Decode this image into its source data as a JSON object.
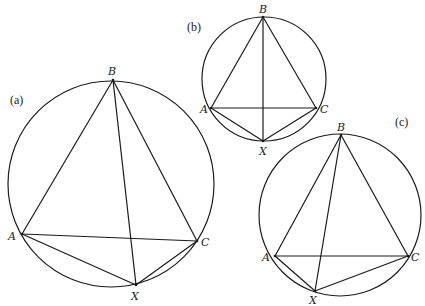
{
  "figure": {
    "width": 425,
    "height": 306,
    "background": "#ffffff",
    "stroke_color": "#1a1a1a"
  },
  "panels": [
    {
      "id": "a",
      "label": "(a)",
      "label_pos": [
        10,
        104
      ],
      "circle": {
        "cx": 111,
        "cy": 184,
        "r": 103
      },
      "points": {
        "A": {
          "label": "A",
          "x": 22,
          "y": 234,
          "lx": 8,
          "ly": 240
        },
        "B": {
          "label": "B",
          "x": 113,
          "y": 80,
          "lx": 108,
          "ly": 75
        },
        "C": {
          "label": "C",
          "x": 197,
          "y": 241,
          "lx": 201,
          "ly": 246
        },
        "X": {
          "label": "X",
          "x": 136,
          "y": 285,
          "lx": 131,
          "ly": 300
        }
      },
      "segments": [
        [
          "A",
          "B"
        ],
        [
          "B",
          "C"
        ],
        [
          "A",
          "C"
        ],
        [
          "B",
          "X"
        ],
        [
          "A",
          "X"
        ],
        [
          "C",
          "X"
        ]
      ]
    },
    {
      "id": "b",
      "label": "(b)",
      "label_pos": [
        187,
        31
      ],
      "circle": {
        "cx": 264,
        "cy": 79,
        "r": 62
      },
      "points": {
        "A": {
          "label": "A",
          "x": 211,
          "y": 108,
          "lx": 200,
          "ly": 113
        },
        "B": {
          "label": "B",
          "x": 263,
          "y": 17,
          "lx": 259,
          "ly": 13
        },
        "C": {
          "label": "C",
          "x": 316,
          "y": 108,
          "lx": 320,
          "ly": 113
        },
        "X": {
          "label": "X",
          "x": 263,
          "y": 141,
          "lx": 259,
          "ly": 155
        }
      },
      "segments": [
        [
          "A",
          "B"
        ],
        [
          "B",
          "C"
        ],
        [
          "A",
          "C"
        ],
        [
          "B",
          "X"
        ],
        [
          "A",
          "X"
        ],
        [
          "C",
          "X"
        ]
      ]
    },
    {
      "id": "c",
      "label": "(c)",
      "label_pos": [
        395,
        126
      ],
      "circle": {
        "cx": 340,
        "cy": 215,
        "r": 81
      },
      "points": {
        "A": {
          "label": "A",
          "x": 275,
          "y": 256,
          "lx": 262,
          "ly": 261
        },
        "B": {
          "label": "B",
          "x": 341,
          "y": 135,
          "lx": 337,
          "ly": 131
        },
        "C": {
          "label": "C",
          "x": 408,
          "y": 256,
          "lx": 411,
          "ly": 261
        },
        "X": {
          "label": "X",
          "x": 315,
          "y": 291,
          "lx": 309,
          "ly": 304
        }
      },
      "segments": [
        [
          "A",
          "B"
        ],
        [
          "B",
          "C"
        ],
        [
          "A",
          "C"
        ],
        [
          "B",
          "X"
        ],
        [
          "A",
          "X"
        ],
        [
          "C",
          "X"
        ]
      ]
    }
  ]
}
